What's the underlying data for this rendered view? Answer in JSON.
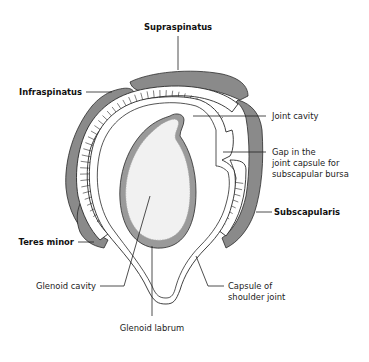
{
  "diagram": {
    "type": "anatomical-cross-section",
    "colors": {
      "muscle": "#8a8a8a",
      "muscle_outline": "#2a2a2a",
      "tendon_stripes": "#ffffff",
      "capsule": "#ffffff",
      "labrum": "#9a9a9a",
      "glenoid_cavity": "#f1f1f1",
      "background": "#ffffff"
    },
    "labels": {
      "supraspinatus": "Supraspinatus",
      "infraspinatus": "Infraspinatus",
      "teres_minor": "Teres minor",
      "subscapularis": "Subscapularis",
      "joint_cavity": "Joint cavity",
      "gap_line1": "Gap in the",
      "gap_line2": "joint capsule for",
      "gap_line3": "subscapular bursa",
      "glenoid_cavity": "Glenoid cavity",
      "glenoid_labrum": "Glenoid labrum",
      "capsule_line1": "Capsule of",
      "capsule_line2": "shoulder joint"
    }
  }
}
